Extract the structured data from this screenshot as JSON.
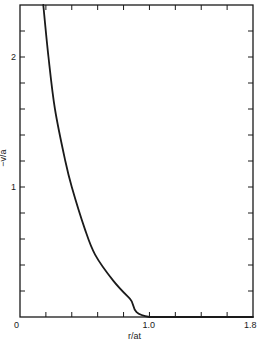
{
  "chart_data": {
    "type": "line",
    "title": "",
    "xlabel": "r/at",
    "ylabel": "−v/a",
    "xlim": [
      0,
      1.8
    ],
    "ylim": [
      0,
      2.4
    ],
    "x_tick_step": 0.2,
    "y_tick_step": 0.2,
    "x_tick_labels": [
      {
        "value": 0,
        "label": "0"
      },
      {
        "value": 1.0,
        "label": "1.0"
      },
      {
        "value": 1.8,
        "label": "1.8"
      }
    ],
    "y_tick_labels": [
      {
        "value": 1,
        "label": "1"
      },
      {
        "value": 2,
        "label": "2"
      }
    ],
    "grid": false,
    "legend": null,
    "series": [
      {
        "name": "-v/a vs r/at",
        "color": "#1a1a1a",
        "x": [
          0.18,
          0.22,
          0.27,
          0.35,
          0.4,
          0.5,
          0.58,
          0.72,
          0.85,
          1.0,
          1.8
        ],
        "y": [
          2.4,
          2.0,
          1.6,
          1.2,
          1.0,
          0.68,
          0.48,
          0.28,
          0.14,
          0.0,
          0.0
        ]
      }
    ]
  }
}
